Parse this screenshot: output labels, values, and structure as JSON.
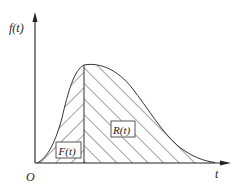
{
  "diagram": {
    "type": "probability-density-function",
    "y_axis_label": "f(t)",
    "x_axis_label": "t",
    "origin_label": "O",
    "regions": [
      {
        "label": "F(t)",
        "hatch": "forward-slash",
        "side": "left of t"
      },
      {
        "label": "R(t)",
        "hatch": "back-slash",
        "side": "right of t"
      }
    ],
    "colors": {
      "ink": "#222222",
      "background": "#ffffff"
    }
  }
}
